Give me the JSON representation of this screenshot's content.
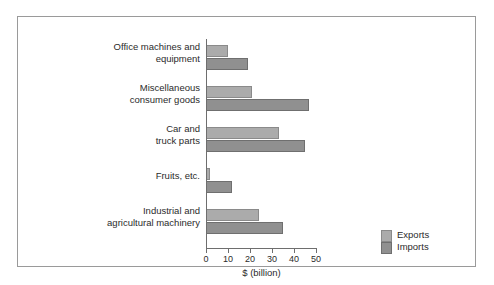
{
  "chart_data": {
    "type": "bar",
    "orientation": "horizontal",
    "title": "",
    "xlabel": "$ (billion)",
    "ylabel": "",
    "xlim": [
      0,
      50
    ],
    "xticks": [
      0,
      10,
      20,
      30,
      40,
      50
    ],
    "grid": false,
    "legend_position": "bottom-right",
    "categories": [
      "Office machines and equipment",
      "Miscellaneous consumer goods",
      "Car and truck parts",
      "Fruits, etc.",
      "Industrial and agricultural machinery"
    ],
    "category_lines": [
      [
        "Office machines and",
        "equipment"
      ],
      [
        "Miscellaneous",
        "consumer goods"
      ],
      [
        "Car and",
        "truck parts"
      ],
      [
        "Fruits, etc."
      ],
      [
        "Industrial and",
        "agricultural machinery"
      ]
    ],
    "series": [
      {
        "name": "Exports",
        "color": "#ababab",
        "values": [
          10,
          21,
          33,
          2,
          24
        ]
      },
      {
        "name": "Imports",
        "color": "#909090",
        "values": [
          19,
          47,
          45,
          12,
          35
        ]
      }
    ]
  },
  "legend": {
    "items": [
      {
        "label": "Exports",
        "swatch": "exports"
      },
      {
        "label": "Imports",
        "swatch": "imports"
      }
    ]
  },
  "axis": {
    "tick_labels": [
      "0",
      "10",
      "20",
      "30",
      "40",
      "50"
    ],
    "x_title": "$ (billion)"
  }
}
